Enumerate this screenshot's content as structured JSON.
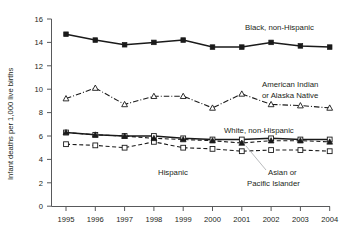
{
  "chart_data": {
    "type": "line",
    "title": "",
    "subtitle": "",
    "xlabel": "",
    "ylabel": "Infant deaths per 1,000 live births",
    "x": [
      1995,
      1996,
      1997,
      1998,
      1999,
      2000,
      2001,
      2002,
      2003,
      2004
    ],
    "xticklabels": [
      "1995",
      "1996",
      "1997",
      "1998",
      "1999",
      "2000",
      "2001",
      "2002",
      "2003",
      "2004"
    ],
    "yticks": [
      0,
      2,
      4,
      6,
      8,
      10,
      12,
      14,
      16
    ],
    "yticklabels": [
      "0",
      "2",
      "4",
      "6",
      "8",
      "10",
      "12",
      "14",
      "16"
    ],
    "ylim": [
      0,
      16
    ],
    "xlim": [
      1995,
      2004
    ],
    "grid": false,
    "legend": "inline-annotations",
    "series": [
      {
        "name": "Black, non-Hispanic",
        "marker": "filled-square",
        "linestyle": "solid",
        "values": [
          14.7,
          14.2,
          13.8,
          14.0,
          14.2,
          13.6,
          13.6,
          14.0,
          13.7,
          13.6
        ]
      },
      {
        "name": "American Indian or Alaska Native",
        "marker": "open-triangle",
        "linestyle": "dash-dot",
        "values": [
          9.2,
          10.1,
          8.7,
          9.4,
          9.4,
          8.4,
          9.6,
          8.7,
          8.6,
          8.4
        ]
      },
      {
        "name": "White, non-Hispanic",
        "marker": "open-square-solid-line",
        "linestyle": "solid",
        "values": [
          6.3,
          6.1,
          6.0,
          6.0,
          5.8,
          5.7,
          5.7,
          5.8,
          5.7,
          5.7
        ]
      },
      {
        "name": "Asian or Pacific Islander",
        "marker": "open-square",
        "linestyle": "dashed",
        "values": [
          5.3,
          5.2,
          5.0,
          5.5,
          5.0,
          4.9,
          4.7,
          4.8,
          4.8,
          4.7
        ]
      },
      {
        "name": "Hispanic",
        "marker": "filled-triangle",
        "linestyle": "dashed",
        "values": [
          6.3,
          6.1,
          6.0,
          5.8,
          5.7,
          5.6,
          5.4,
          5.6,
          5.6,
          5.5
        ]
      }
    ],
    "annotations": [
      {
        "text": "Black, non-Hispanic",
        "x": 245,
        "y": 30
      },
      {
        "text": "American Indian",
        "x": 262,
        "y": 87
      },
      {
        "text": "or Alaska Native",
        "x": 262,
        "y": 98
      },
      {
        "text": "White, non-Hispanic",
        "x": 224,
        "y": 133
      },
      {
        "text": "Hispanic",
        "x": 158,
        "y": 175
      },
      {
        "text": "Asian or",
        "x": 268,
        "y": 175
      },
      {
        "text": "Pacific Islander",
        "x": 247,
        "y": 186
      }
    ]
  }
}
